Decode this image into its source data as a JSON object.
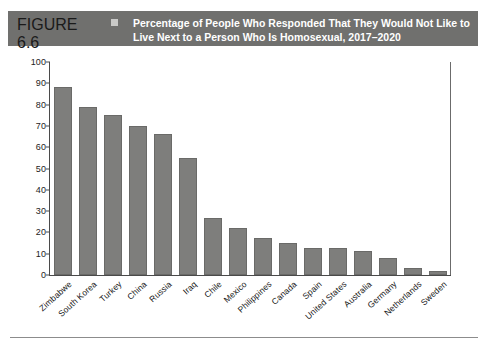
{
  "header": {
    "figure_label": "FIGURE 6.6",
    "marker": "square-marker",
    "title_line1": "Percentage of People Who Responded That They Would Not Like to",
    "title_line2": "Live Next to a Person Who Is Homosexual, 2017–2020",
    "background_color": "#70706e",
    "text_color": "#ffffff"
  },
  "footer": {
    "note": ""
  },
  "chart_data": {
    "type": "bar",
    "title": "Percentage of People Who Responded That They Would Not Like to Live Next to a Person Who Is Homosexual, 2017–2020",
    "xlabel": "",
    "ylabel": "",
    "ylim": [
      0,
      100
    ],
    "yticks": [
      0,
      10,
      20,
      30,
      40,
      50,
      60,
      70,
      80,
      90,
      100
    ],
    "grid": false,
    "legend": "none",
    "bar_color": "#7e7e7c",
    "categories": [
      "Zimbabwe",
      "South Korea",
      "Turkey",
      "China",
      "Russia",
      "Iraq",
      "Chile",
      "Mexico",
      "Philippines",
      "Canada",
      "Spain",
      "United States",
      "Australia",
      "Germany",
      "Netherlands",
      "Sweden"
    ],
    "values": [
      88.5,
      79,
      75,
      70,
      66,
      55,
      27,
      22,
      17.5,
      15,
      12.5,
      12.5,
      11.5,
      8,
      3.5,
      2
    ]
  }
}
